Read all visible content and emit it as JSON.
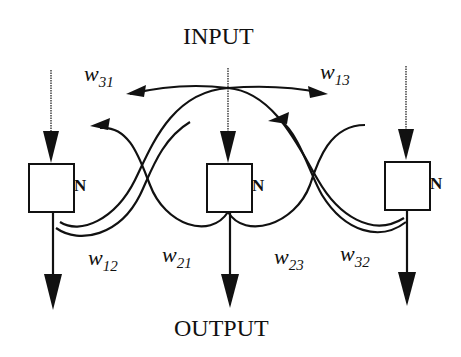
{
  "diagram": {
    "title_top": "INPUT",
    "title_bottom": "OUTPUT",
    "node_label": "N",
    "nodes": [
      {
        "id": "node-1",
        "label": "N"
      },
      {
        "id": "node-2",
        "label": "N"
      },
      {
        "id": "node-3",
        "label": "N"
      }
    ],
    "weights": [
      {
        "base": "w",
        "sub": "31"
      },
      {
        "base": "w",
        "sub": "13"
      },
      {
        "base": "w",
        "sub": "12"
      },
      {
        "base": "w",
        "sub": "21"
      },
      {
        "base": "w",
        "sub": "23"
      },
      {
        "base": "w",
        "sub": "32"
      }
    ],
    "colors": {
      "line": "#111111",
      "background": "#ffffff"
    }
  }
}
